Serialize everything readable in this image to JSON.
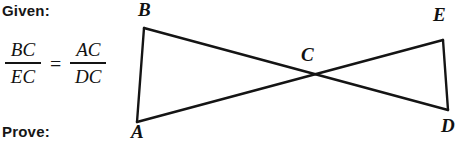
{
  "problem": {
    "given_label": "Given:",
    "prove_label": "Prove:",
    "proportion": {
      "left": {
        "numerator": "BC",
        "denominator": "EC"
      },
      "relation": "=",
      "right": {
        "numerator": "AC",
        "denominator": "DC"
      }
    }
  },
  "figure": {
    "type": "geometry-diagram",
    "stroke_color": "#141414",
    "background_color": "#ffffff",
    "stroke_width": 2.4,
    "points": {
      "A": {
        "x": 137,
        "y": 122,
        "label": "A"
      },
      "B": {
        "x": 144,
        "y": 28,
        "label": "B"
      },
      "C": {
        "x": 310,
        "y": 76,
        "label": "C"
      },
      "D": {
        "x": 448,
        "y": 110,
        "label": "D"
      },
      "E": {
        "x": 443,
        "y": 40,
        "label": "E"
      }
    },
    "segments": [
      {
        "name": "AB",
        "from": "A",
        "to": "B"
      },
      {
        "name": "BD",
        "from": "B",
        "to": "D"
      },
      {
        "name": "AE",
        "from": "A",
        "to": "E"
      },
      {
        "name": "ED",
        "from": "E",
        "to": "D"
      }
    ]
  }
}
